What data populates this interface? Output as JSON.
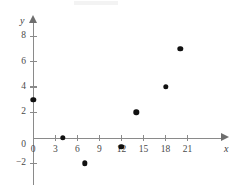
{
  "chart_data": {
    "type": "scatter",
    "title": "",
    "xlabel": "x",
    "ylabel": "y",
    "xlim": [
      -1.5,
      23.5
    ],
    "ylim": [
      -3.2,
      9.5
    ],
    "grid": false,
    "legend": null,
    "x_ticks": [
      0,
      3,
      6,
      9,
      12,
      15,
      18,
      21
    ],
    "y_ticks": [
      -2,
      0,
      2,
      4,
      6,
      8
    ],
    "x_tick_labels": [
      "0",
      "3",
      "6",
      "9",
      "12",
      "15",
      "18",
      "21"
    ],
    "y_tick_labels": [
      "−2",
      "0",
      "2",
      "4",
      "6",
      "8"
    ],
    "point_color": "#111111",
    "axis_color": "#8a8a8a",
    "points": [
      {
        "x": 0,
        "y": 3
      },
      {
        "x": 4,
        "y": 0
      },
      {
        "x": 7,
        "y": -2
      },
      {
        "x": 12,
        "y": -0.7
      },
      {
        "x": 14,
        "y": 2
      },
      {
        "x": 18,
        "y": 4
      },
      {
        "x": 20,
        "y": 7
      }
    ]
  }
}
